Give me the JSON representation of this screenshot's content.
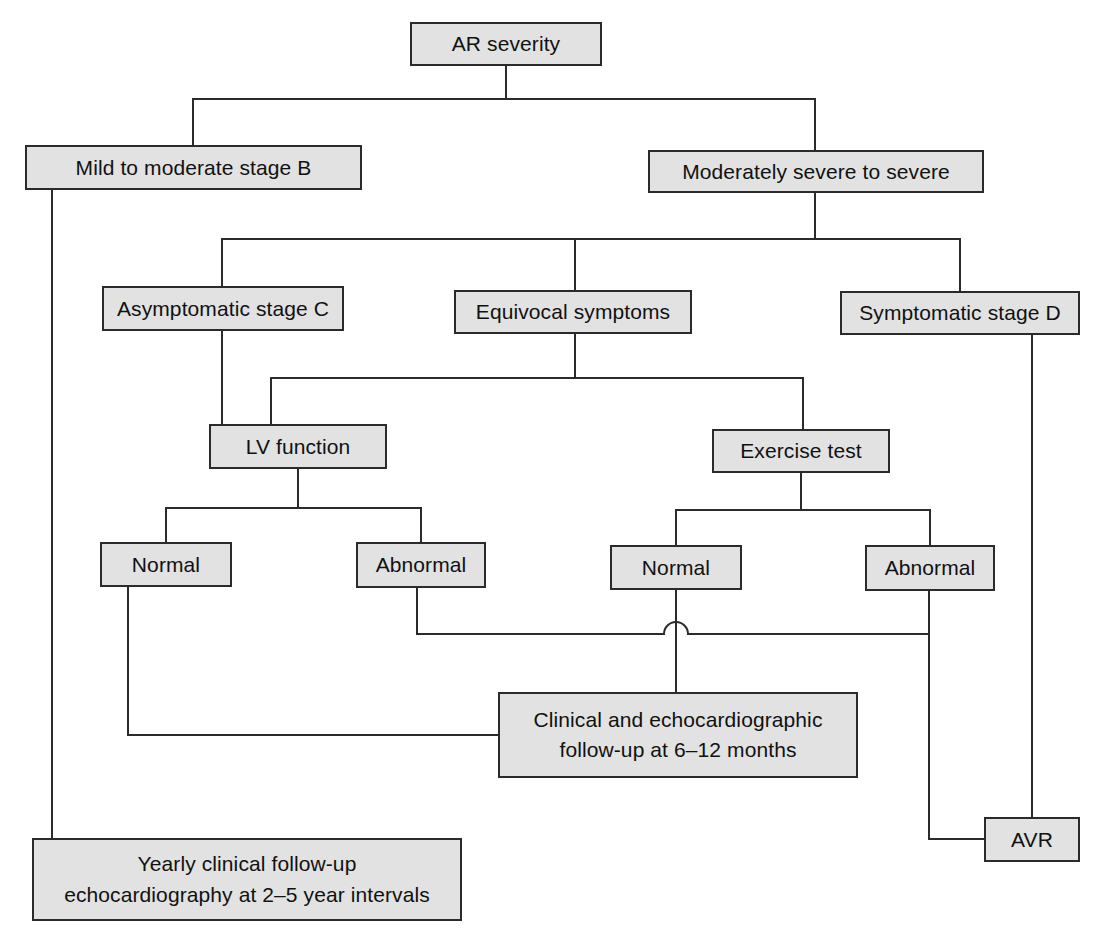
{
  "diagram": {
    "style": {
      "node_fill": "#e2e2e2",
      "node_border": "#2b2b2b",
      "edge_color": "#2b2b2b",
      "background": "#ffffff",
      "text_color": "#111111"
    },
    "nodes": [
      {
        "id": "ar-severity",
        "label": "AR severity",
        "x": 410,
        "y": 22,
        "w": 192,
        "h": 44
      },
      {
        "id": "mild-moderate-b",
        "label": "Mild to moderate stage B",
        "x": 25,
        "y": 145,
        "w": 337,
        "h": 45
      },
      {
        "id": "moderately-severe",
        "label": "Moderately severe to severe",
        "x": 648,
        "y": 150,
        "w": 336,
        "h": 43
      },
      {
        "id": "asymptomatic-c",
        "label": "Asymptomatic stage C",
        "x": 102,
        "y": 286,
        "w": 242,
        "h": 45
      },
      {
        "id": "equivocal-symptoms",
        "label": "Equivocal symptoms",
        "x": 454,
        "y": 290,
        "w": 238,
        "h": 44
      },
      {
        "id": "symptomatic-d",
        "label": "Symptomatic stage D",
        "x": 840,
        "y": 291,
        "w": 240,
        "h": 44
      },
      {
        "id": "lv-function",
        "label": "LV function",
        "x": 209,
        "y": 424,
        "w": 178,
        "h": 45
      },
      {
        "id": "exercise-test",
        "label": "Exercise test",
        "x": 712,
        "y": 429,
        "w": 178,
        "h": 44
      },
      {
        "id": "lv-normal",
        "label": "Normal",
        "x": 100,
        "y": 542,
        "w": 132,
        "h": 45
      },
      {
        "id": "lv-abnormal",
        "label": "Abnormal",
        "x": 356,
        "y": 542,
        "w": 130,
        "h": 46
      },
      {
        "id": "ex-normal",
        "label": "Normal",
        "x": 610,
        "y": 545,
        "w": 132,
        "h": 45
      },
      {
        "id": "ex-abnormal",
        "label": "Abnormal",
        "x": 865,
        "y": 545,
        "w": 130,
        "h": 46
      },
      {
        "id": "clinical-followup",
        "label": "Clinical and echocardiographic\nfollow-up at 6–12 months",
        "x": 498,
        "y": 692,
        "w": 360,
        "h": 86
      },
      {
        "id": "avr",
        "label": "AVR",
        "x": 984,
        "y": 817,
        "w": 96,
        "h": 45
      },
      {
        "id": "yearly-followup",
        "label": "Yearly clinical follow-up\nechocardiography at 2–5 year intervals",
        "x": 32,
        "y": 838,
        "w": 430,
        "h": 83
      }
    ],
    "edges": [
      {
        "id": "edge-ar-to-split",
        "from": "ar-severity",
        "to": "level-2-bus",
        "path": "M506,66 L506,99 M193,99 L815,99 M193,99 L193,145 M815,99 L815,150"
      },
      {
        "id": "edge-moderate-to-level3-bus",
        "from": "moderately-severe",
        "to": "level-3-bus",
        "path": "M815,193 L815,239 M222,239 L960,239 M222,239 L222,286 M575,239 L575,290 M960,239 L960,291"
      },
      {
        "id": "edge-asymptomatic-to-lv",
        "from": "asymptomatic-c",
        "to": "lv-function",
        "path": "M222,331 L222,424"
      },
      {
        "id": "edge-equivocal-to-level4-bus",
        "from": "equivocal-symptoms",
        "to": "level-4-bus",
        "path": "M575,334 L575,378 M271,378 L803,378 M271,378 L271,424 M803,378 L803,429"
      },
      {
        "id": "edge-lv-to-children",
        "from": "lv-function",
        "to": "lv-branch-bus",
        "path": "M298,469 L298,508 M166,508 L421,508 M166,508 L166,542 M421,508 L421,542"
      },
      {
        "id": "edge-exercise-to-children",
        "from": "exercise-test",
        "to": "exercise-branch-bus",
        "path": "M801,473 L801,510 M676,510 L930,510 M676,510 L676,545 M930,510 L930,545"
      },
      {
        "id": "edge-lv-normal-to-followup",
        "from": "lv-normal",
        "to": "clinical-followup",
        "path": "M128,587 L128,735 L498,735"
      },
      {
        "id": "edge-lv-abnormal-to-followup",
        "from": "lv-abnormal",
        "to": "clinical-followup",
        "path": "M417,588 L417,634 L664,634 M688,634 L929,634"
      },
      {
        "id": "edge-ex-normal-to-followup",
        "from": "ex-normal",
        "to": "clinical-followup",
        "path": "M676,590 L676,692"
      },
      {
        "id": "edge-line-hop",
        "from": "lv-abnormal",
        "to": "ex-normal",
        "path": "M664,634 A12,12 0 0 1 688,634"
      },
      {
        "id": "edge-ex-abnormal-to-avr",
        "from": "ex-abnormal",
        "to": "avr",
        "path": "M929,591 L929,839 L984,839"
      },
      {
        "id": "edge-symptomatic-to-avr",
        "from": "symptomatic-d",
        "to": "avr",
        "path": "M1032,335 L1032,817"
      },
      {
        "id": "edge-mild-to-yearly",
        "from": "mild-moderate-b",
        "to": "yearly-followup",
        "path": "M52,190 L52,838"
      }
    ]
  }
}
